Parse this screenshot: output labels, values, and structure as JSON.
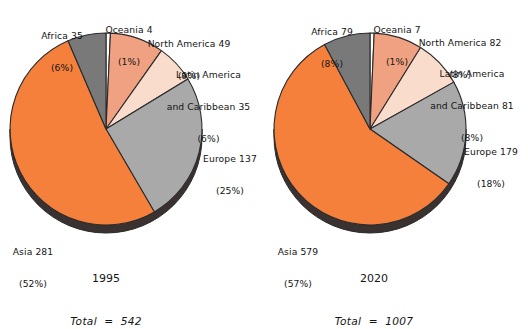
{
  "figure": {
    "background": "#ffffff",
    "text_color": "#141414"
  },
  "palette": {
    "oceania": "#ffffff",
    "north_america": "#f0a181",
    "latin_america": "#f9dccb",
    "europe": "#a9a9a9",
    "asia": "#f4803c",
    "africa": "#797979",
    "edge": "#2b2b2b",
    "depth": "#3a3230"
  },
  "chart_data": [
    {
      "type": "pie",
      "title": "1995",
      "total_label": "Total  =  542",
      "total_value": 542,
      "unit": "millions",
      "start_angle_deg": 0,
      "direction": "clockwise",
      "categories": [
        "Oceania",
        "North America",
        "Latin America and Caribbean",
        "Europe",
        "Asia",
        "Africa"
      ],
      "values": [
        4,
        49,
        35,
        137,
        281,
        35
      ],
      "percents": [
        1,
        9,
        6,
        25,
        52,
        6
      ],
      "colors": [
        "#ffffff",
        "#f0a181",
        "#f9dccb",
        "#a9a9a9",
        "#f4803c",
        "#797979"
      ],
      "labels": [
        {
          "name": "Oceania",
          "line1": "Oceania 4",
          "line2": "(1%)"
        },
        {
          "name": "North America",
          "line1": "North America 49",
          "line2": "(9%)"
        },
        {
          "name": "Latin America and Caribbean",
          "line1": "Latin America",
          "line2": "and Caribbean 35",
          "line3": "(6%)"
        },
        {
          "name": "Europe",
          "line1": "Europe 137",
          "line2": "(25%)"
        },
        {
          "name": "Asia",
          "line1": "Asia 281",
          "line2": "(52%)"
        },
        {
          "name": "Africa",
          "line1": "Africa 35",
          "line2": "(6%)"
        }
      ]
    },
    {
      "type": "pie",
      "title": "2020",
      "total_label": "Total  =  1007",
      "total_value": 1007,
      "unit": "millions",
      "start_angle_deg": 0,
      "direction": "clockwise",
      "categories": [
        "Oceania",
        "North America",
        "Latin America and Caribbean",
        "Europe",
        "Asia",
        "Africa"
      ],
      "values": [
        7,
        82,
        81,
        179,
        579,
        79
      ],
      "percents": [
        1,
        8,
        8,
        18,
        57,
        8
      ],
      "colors": [
        "#ffffff",
        "#f0a181",
        "#f9dccb",
        "#a9a9a9",
        "#f4803c",
        "#797979"
      ],
      "labels": [
        {
          "name": "Oceania",
          "line1": "Oceania 7",
          "line2": "(1%)"
        },
        {
          "name": "North America",
          "line1": "North America 82",
          "line2": "(8%)"
        },
        {
          "name": "Latin America and Caribbean",
          "line1": "Latin America",
          "line2": "and Caribbean 81",
          "line3": "(8%)"
        },
        {
          "name": "Europe",
          "line1": "Europe 179",
          "line2": "(18%)"
        },
        {
          "name": "Asia",
          "line1": "Asia 579",
          "line2": "(57%)"
        },
        {
          "name": "Africa",
          "line1": "Africa 79",
          "line2": "(8%)"
        }
      ]
    }
  ]
}
